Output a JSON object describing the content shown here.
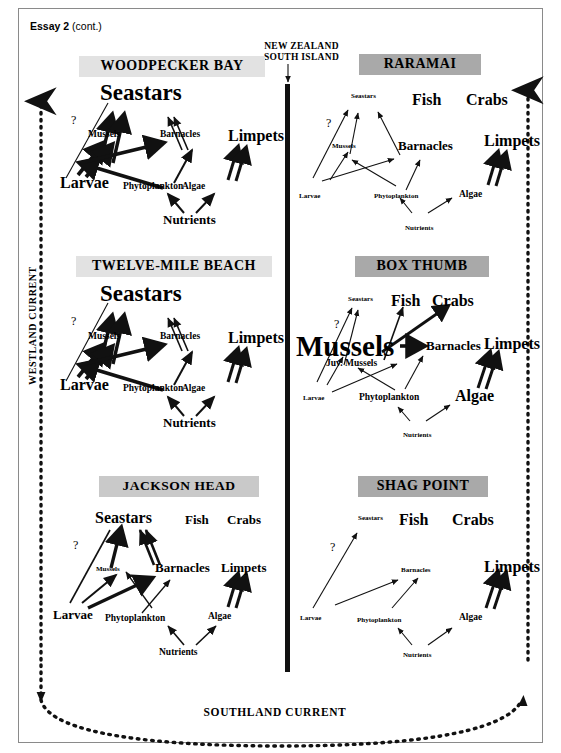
{
  "header": {
    "essay": "Essay 2",
    "continued": "(cont.)"
  },
  "map": {
    "region_label_line1": "NEW ZEALAND",
    "region_label_line2": "SOUTH ISLAND",
    "west_current": "WESTLAND CURRENT",
    "south_current": "SOUTHLAND CURRENT"
  },
  "nodes": {
    "seastars": "Seastars",
    "mussels": "Mussels",
    "juv_mussels": "Juv. Mussels",
    "barnacles": "Barnacles",
    "limpets": "Limpets",
    "larvae": "Larvae",
    "phytoplankton": "Phytoplankton",
    "algae": "Algae",
    "nutrients": "Nutrients",
    "fish": "Fish",
    "crabs": "Crabs",
    "question": "?"
  },
  "sites": [
    {
      "id": "woodpecker-bay",
      "title": "WOODPECKER BAY",
      "column": "west",
      "row": 1,
      "present": [
        "Seastars",
        "Mussels",
        "Barnacles",
        "Limpets",
        "Larvae",
        "Phytoplankton",
        "Algae",
        "Nutrients"
      ],
      "absent": [
        "Fish",
        "Crabs"
      ],
      "dominant": "Seastars",
      "links": [
        {
          "from": "Larvae",
          "to": "Seastars",
          "weight": "thin",
          "uncertain": true
        },
        {
          "from": "Mussels",
          "to": "Seastars",
          "weight": "thick"
        },
        {
          "from": "Barnacles",
          "to": "Seastars",
          "weight": "thin"
        },
        {
          "from": "Larvae",
          "to": "Mussels",
          "weight": "thick"
        },
        {
          "from": "Phytoplankton",
          "to": "Mussels",
          "weight": "thick"
        },
        {
          "from": "Phytoplankton",
          "to": "Barnacles",
          "weight": "medium"
        },
        {
          "from": "Algae",
          "to": "Limpets",
          "weight": "thick"
        },
        {
          "from": "Nutrients",
          "to": "Phytoplankton",
          "weight": "medium"
        },
        {
          "from": "Nutrients",
          "to": "Algae",
          "weight": "medium"
        }
      ]
    },
    {
      "id": "raramai",
      "title": "RARAMAI",
      "column": "east",
      "row": 1,
      "present": [
        "Seastars",
        "Mussels",
        "Barnacles",
        "Limpets",
        "Larvae",
        "Phytoplankton",
        "Algae",
        "Nutrients",
        "Fish",
        "Crabs"
      ],
      "absent": [],
      "dominant": "Limpets",
      "links": [
        {
          "from": "Larvae",
          "to": "Seastars",
          "weight": "thin",
          "uncertain": true
        },
        {
          "from": "Mussels",
          "to": "Seastars",
          "weight": "thin"
        },
        {
          "from": "Barnacles",
          "to": "Seastars",
          "weight": "thin"
        },
        {
          "from": "Larvae",
          "to": "Mussels",
          "weight": "thin"
        },
        {
          "from": "Phytoplankton",
          "to": "Mussels",
          "weight": "thin"
        },
        {
          "from": "Phytoplankton",
          "to": "Barnacles",
          "weight": "thin"
        },
        {
          "from": "Algae",
          "to": "Limpets",
          "weight": "thick"
        },
        {
          "from": "Nutrients",
          "to": "Phytoplankton",
          "weight": "thin"
        },
        {
          "from": "Nutrients",
          "to": "Algae",
          "weight": "thin"
        }
      ]
    },
    {
      "id": "twelve-mile-beach",
      "title": "TWELVE-MILE BEACH",
      "column": "west",
      "row": 2,
      "present": [
        "Seastars",
        "Mussels",
        "Barnacles",
        "Limpets",
        "Larvae",
        "Phytoplankton",
        "Algae",
        "Nutrients"
      ],
      "absent": [
        "Fish",
        "Crabs"
      ],
      "dominant": "Seastars",
      "links": [
        {
          "from": "Larvae",
          "to": "Seastars",
          "weight": "thin",
          "uncertain": true
        },
        {
          "from": "Mussels",
          "to": "Seastars",
          "weight": "thick"
        },
        {
          "from": "Barnacles",
          "to": "Seastars",
          "weight": "thin"
        },
        {
          "from": "Larvae",
          "to": "Mussels",
          "weight": "thick"
        },
        {
          "from": "Phytoplankton",
          "to": "Mussels",
          "weight": "thick"
        },
        {
          "from": "Phytoplankton",
          "to": "Barnacles",
          "weight": "medium"
        },
        {
          "from": "Algae",
          "to": "Limpets",
          "weight": "thick"
        },
        {
          "from": "Nutrients",
          "to": "Phytoplankton",
          "weight": "medium"
        },
        {
          "from": "Nutrients",
          "to": "Algae",
          "weight": "medium"
        }
      ]
    },
    {
      "id": "box-thumb",
      "title": "BOX THUMB",
      "column": "east",
      "row": 2,
      "present": [
        "Seastars",
        "Mussels",
        "Juv. Mussels",
        "Barnacles",
        "Limpets",
        "Larvae",
        "Phytoplankton",
        "Algae",
        "Nutrients",
        "Fish",
        "Crabs"
      ],
      "absent": [],
      "dominant": "Mussels",
      "links": [
        {
          "from": "Larvae",
          "to": "Seastars",
          "weight": "thin",
          "uncertain": true
        },
        {
          "from": "Juv. Mussels",
          "to": "Seastars",
          "weight": "thin"
        },
        {
          "from": "Juv. Mussels",
          "to": "Fish",
          "weight": "thin"
        },
        {
          "from": "Juv. Mussels",
          "to": "Crabs",
          "weight": "thick"
        },
        {
          "from": "Larvae",
          "to": "Juv. Mussels",
          "weight": "thin"
        },
        {
          "from": "Phytoplankton",
          "to": "Mussels",
          "weight": "thin"
        },
        {
          "from": "Mussels",
          "to": "Barnacles",
          "weight": "thick"
        },
        {
          "from": "Phytoplankton",
          "to": "Barnacles",
          "weight": "thin"
        },
        {
          "from": "Nutrients",
          "to": "Phytoplankton",
          "weight": "thin"
        },
        {
          "from": "Nutrients",
          "to": "Algae",
          "weight": "thin"
        }
      ]
    },
    {
      "id": "jackson-head",
      "title": "JACKSON HEAD",
      "column": "west",
      "row": 3,
      "present": [
        "Seastars",
        "Mussels",
        "Barnacles",
        "Limpets",
        "Larvae",
        "Phytoplankton",
        "Algae",
        "Nutrients",
        "Fish",
        "Crabs"
      ],
      "absent": [],
      "dominant": "Seastars",
      "links": [
        {
          "from": "Larvae",
          "to": "Seastars",
          "weight": "thin",
          "uncertain": true
        },
        {
          "from": "Mussels",
          "to": "Seastars",
          "weight": "thick"
        },
        {
          "from": "Barnacles",
          "to": "Seastars",
          "weight": "thick"
        },
        {
          "from": "Larvae",
          "to": "Mussels",
          "weight": "medium"
        },
        {
          "from": "Phytoplankton",
          "to": "Mussels",
          "weight": "thin"
        },
        {
          "from": "Larvae",
          "to": "Barnacles",
          "weight": "thick"
        },
        {
          "from": "Phytoplankton",
          "to": "Barnacles",
          "weight": "thin"
        },
        {
          "from": "Algae",
          "to": "Limpets",
          "weight": "thick"
        },
        {
          "from": "Nutrients",
          "to": "Phytoplankton",
          "weight": "thin"
        },
        {
          "from": "Nutrients",
          "to": "Algae",
          "weight": "thin"
        }
      ]
    },
    {
      "id": "shag-point",
      "title": "SHAG POINT",
      "column": "east",
      "row": 3,
      "present": [
        "Seastars",
        "Barnacles",
        "Limpets",
        "Larvae",
        "Phytoplankton",
        "Algae",
        "Nutrients",
        "Fish",
        "Crabs"
      ],
      "absent": [
        "Mussels"
      ],
      "dominant": "Limpets",
      "links": [
        {
          "from": "Larvae",
          "to": "Seastars",
          "weight": "thin",
          "uncertain": true
        },
        {
          "from": "Larvae",
          "to": "Barnacles",
          "weight": "thin"
        },
        {
          "from": "Phytoplankton",
          "to": "Barnacles",
          "weight": "thin"
        },
        {
          "from": "Algae",
          "to": "Limpets",
          "weight": "thick"
        },
        {
          "from": "Nutrients",
          "to": "Phytoplankton",
          "weight": "thin"
        },
        {
          "from": "Nutrients",
          "to": "Algae",
          "weight": "thin"
        }
      ]
    }
  ],
  "colors": {
    "header_light": "#e2e2e2",
    "header_mid": "#c9c9c9",
    "header_dark": "#a9a9a9",
    "ink": "#000000",
    "frame": "#8a8a8a"
  }
}
